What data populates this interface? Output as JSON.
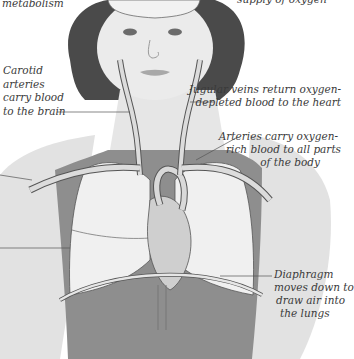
{
  "figure": {
    "colors": {
      "background": "#ffffff",
      "skin": "#e4e4e4",
      "skin_shadow": "#c9c9c9",
      "hair": "#4a4a4a",
      "top_garment": "#8e8e8e",
      "lung": "#efefef",
      "vessel": "#d4d4d4",
      "outline": "#555555",
      "label_text": "#3a3a3a",
      "leader_line": "#555555"
    }
  },
  "labels": {
    "metabolism": [
      "metabolism"
    ],
    "oxygen_supply": [
      "supply of oxygen"
    ],
    "carotid": [
      "Carotid",
      "arteries",
      "carry blood",
      "to the brain"
    ],
    "jugular": [
      "Jugular veins return oxygen-",
      "depleted blood to the heart"
    ],
    "arteries": [
      "Arteries carry oxygen-",
      "rich blood to all parts",
      "of the body"
    ],
    "diaphragm": [
      "Diaphragm",
      "moves down to",
      "draw air into",
      "the lungs"
    ]
  }
}
